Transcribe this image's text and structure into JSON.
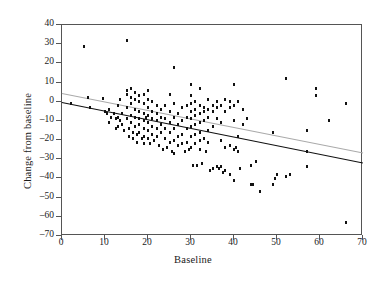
{
  "figure": {
    "type": "scatter",
    "background": "#ffffff",
    "frame_color": "#555555"
  },
  "axes": {
    "x": {
      "label": "Baseline",
      "min": 0,
      "max": 70,
      "ticks": [
        0,
        10,
        20,
        30,
        40,
        50,
        60,
        70
      ],
      "tick_labels": [
        "0",
        "10",
        "20",
        "30",
        "40",
        "50",
        "60",
        "70"
      ]
    },
    "y": {
      "label": "Change from baseline",
      "min": -70,
      "max": 40,
      "ticks": [
        40,
        30,
        20,
        10,
        0,
        -10,
        -20,
        -30,
        -40,
        -50,
        -60,
        -70
      ],
      "tick_labels": [
        "40",
        "30",
        "20",
        "10",
        "0",
        "–10",
        "–20",
        "–30",
        "–40",
        "–50",
        "–60",
        "–70"
      ]
    }
  },
  "chart_data": {
    "type": "scatter",
    "title": "",
    "xlabel": "Baseline",
    "ylabel": "Change from baseline",
    "xlim": [
      0,
      70
    ],
    "ylim": [
      -70,
      40
    ],
    "grid": false,
    "legend": false,
    "marker": {
      "shape": "square",
      "color": "#111111",
      "size": 2.5
    },
    "series": [
      {
        "name": "observations",
        "points": [
          [
            2,
            -1
          ],
          [
            5,
            29
          ],
          [
            6,
            2
          ],
          [
            6.5,
            -3
          ],
          [
            9.5,
            1.5
          ],
          [
            10,
            -5
          ],
          [
            10.5,
            -6
          ],
          [
            11,
            -4
          ],
          [
            11,
            -11
          ],
          [
            11.5,
            -8
          ],
          [
            12,
            -6
          ],
          [
            12.5,
            -9
          ],
          [
            12.5,
            -14
          ],
          [
            13,
            -2
          ],
          [
            13,
            -8
          ],
          [
            13,
            -13
          ],
          [
            13.5,
            1
          ],
          [
            13.5,
            -10
          ],
          [
            14,
            -6
          ],
          [
            14,
            -12
          ],
          [
            14.5,
            -15
          ],
          [
            15,
            32
          ],
          [
            15,
            6
          ],
          [
            15,
            4
          ],
          [
            15,
            -3
          ],
          [
            15,
            -9
          ],
          [
            15.5,
            -14
          ],
          [
            15.5,
            -18
          ],
          [
            16,
            7
          ],
          [
            16,
            2
          ],
          [
            16,
            -1
          ],
          [
            16,
            -7
          ],
          [
            16,
            -11
          ],
          [
            16.5,
            -16
          ],
          [
            16.5,
            -19
          ],
          [
            17,
            5
          ],
          [
            17,
            1
          ],
          [
            17,
            -4
          ],
          [
            17,
            -8
          ],
          [
            17,
            -13
          ],
          [
            17.5,
            -17
          ],
          [
            17.5,
            -21
          ],
          [
            18,
            3
          ],
          [
            18,
            0
          ],
          [
            18,
            -5
          ],
          [
            18,
            -9
          ],
          [
            18,
            -12
          ],
          [
            18,
            -16
          ],
          [
            18.5,
            -19
          ],
          [
            19,
            4
          ],
          [
            19,
            -1
          ],
          [
            19,
            -6
          ],
          [
            19,
            -10
          ],
          [
            19,
            -14
          ],
          [
            19,
            -18
          ],
          [
            19,
            -22
          ],
          [
            19.5,
            -8
          ],
          [
            20,
            6
          ],
          [
            20,
            1
          ],
          [
            20,
            -3
          ],
          [
            20,
            -7
          ],
          [
            20,
            -11
          ],
          [
            20,
            -15
          ],
          [
            20,
            -19
          ],
          [
            20.5,
            -22
          ],
          [
            21,
            0
          ],
          [
            21,
            -5
          ],
          [
            21,
            -9
          ],
          [
            21,
            -13
          ],
          [
            21,
            -17
          ],
          [
            21.5,
            -20
          ],
          [
            22,
            -2
          ],
          [
            22,
            -6
          ],
          [
            22,
            -10
          ],
          [
            22,
            -14
          ],
          [
            22,
            -18
          ],
          [
            22.5,
            -23
          ],
          [
            23,
            -4
          ],
          [
            23,
            -8
          ],
          [
            23,
            -12
          ],
          [
            23,
            -16
          ],
          [
            23.5,
            -25
          ],
          [
            24,
            -2
          ],
          [
            24,
            -9
          ],
          [
            24,
            -14
          ],
          [
            24,
            -19
          ],
          [
            24.5,
            -24
          ],
          [
            25,
            4
          ],
          [
            25,
            -5
          ],
          [
            25,
            -11
          ],
          [
            25,
            -16
          ],
          [
            25,
            -21
          ],
          [
            25.5,
            -26
          ],
          [
            26,
            18
          ],
          [
            26,
            -1
          ],
          [
            26,
            -8
          ],
          [
            26,
            -14
          ],
          [
            26,
            -20
          ],
          [
            26,
            -27
          ],
          [
            27,
            -6
          ],
          [
            27,
            -12
          ],
          [
            27,
            -18
          ],
          [
            27,
            -23
          ],
          [
            28,
            -3
          ],
          [
            28,
            -10
          ],
          [
            28,
            -17
          ],
          [
            28,
            -22
          ],
          [
            28.5,
            -26
          ],
          [
            29,
            -2
          ],
          [
            29,
            -8
          ],
          [
            29,
            -14
          ],
          [
            29,
            -21
          ],
          [
            29.5,
            -25
          ],
          [
            30,
            9
          ],
          [
            30,
            3
          ],
          [
            30,
            -1
          ],
          [
            30,
            -5
          ],
          [
            30,
            -9
          ],
          [
            30,
            -13
          ],
          [
            30,
            -18
          ],
          [
            30,
            -24
          ],
          [
            30.5,
            -33
          ],
          [
            31,
            0
          ],
          [
            31,
            -4
          ],
          [
            31,
            -7
          ],
          [
            31,
            -12
          ],
          [
            31,
            -17
          ],
          [
            31,
            -22
          ],
          [
            31.5,
            -33
          ],
          [
            32,
            7
          ],
          [
            32,
            -2
          ],
          [
            32,
            -6
          ],
          [
            32,
            -11
          ],
          [
            32,
            -16
          ],
          [
            32,
            -20
          ],
          [
            32,
            -25
          ],
          [
            32.5,
            -32
          ],
          [
            33,
            -3
          ],
          [
            33,
            -5
          ],
          [
            33,
            -10
          ],
          [
            33,
            -19
          ],
          [
            33.5,
            -26
          ],
          [
            34,
            1
          ],
          [
            34,
            -4
          ],
          [
            34,
            -8
          ],
          [
            34,
            -15
          ],
          [
            34,
            -21
          ],
          [
            34.5,
            -36
          ],
          [
            35,
            -2
          ],
          [
            35,
            -5
          ],
          [
            35,
            -13
          ],
          [
            35,
            -35
          ],
          [
            36,
            0
          ],
          [
            36,
            -3
          ],
          [
            36,
            -9
          ],
          [
            36,
            -34
          ],
          [
            36.5,
            -35
          ],
          [
            37,
            -2
          ],
          [
            37,
            -11
          ],
          [
            37,
            -20
          ],
          [
            37,
            -34
          ],
          [
            37.5,
            -37
          ],
          [
            38,
            1
          ],
          [
            38,
            -5
          ],
          [
            38,
            -24
          ],
          [
            38,
            -36
          ],
          [
            39,
            0
          ],
          [
            39,
            -3
          ],
          [
            39,
            -23
          ],
          [
            39,
            -38
          ],
          [
            40,
            9
          ],
          [
            40,
            -2
          ],
          [
            40,
            -10
          ],
          [
            40,
            -25
          ],
          [
            40,
            -41
          ],
          [
            40.5,
            -24
          ],
          [
            41,
            0
          ],
          [
            41,
            -18
          ],
          [
            41,
            -26
          ],
          [
            41.5,
            -35
          ],
          [
            42,
            -4
          ],
          [
            42,
            -12
          ],
          [
            43,
            -9
          ],
          [
            44,
            -33
          ],
          [
            44,
            -43
          ],
          [
            44.5,
            -43
          ],
          [
            45,
            -31
          ],
          [
            46,
            -47
          ],
          [
            49,
            -16
          ],
          [
            49,
            -43
          ],
          [
            49.5,
            -40
          ],
          [
            50,
            -38
          ],
          [
            52,
            12
          ],
          [
            52,
            -39
          ],
          [
            53,
            -38
          ],
          [
            57,
            -15
          ],
          [
            57,
            -26
          ],
          [
            57,
            -34
          ],
          [
            59,
            7
          ],
          [
            59,
            3
          ],
          [
            62,
            -10
          ],
          [
            66,
            -1
          ],
          [
            66,
            -63
          ]
        ]
      }
    ],
    "lines": [
      {
        "name": "upper-fit-line",
        "color": "#aaaaaa",
        "width": 1.2,
        "x0": 0,
        "y0": 4.5,
        "x1": 70,
        "y1": -26.5
      },
      {
        "name": "lower-fit-line",
        "color": "#111111",
        "width": 1.4,
        "x0": 0,
        "y0": 0.0,
        "x1": 70,
        "y1": -31.5
      }
    ]
  }
}
